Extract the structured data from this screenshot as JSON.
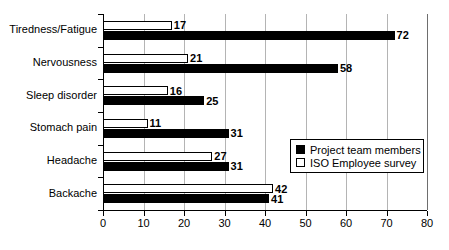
{
  "chart_data": {
    "type": "bar",
    "orientation": "horizontal",
    "title": "",
    "xlabel": "",
    "ylabel": "",
    "xlim": [
      0,
      80
    ],
    "xticks": [
      0,
      10,
      20,
      30,
      40,
      50,
      60,
      70,
      80
    ],
    "grid": true,
    "grid_axis": "x",
    "legend_position": "center-right",
    "categories": [
      "Tiredness/Fatigue",
      "Nervousness",
      "Sleep disorder",
      "Stomach pain",
      "Headache",
      "Backache"
    ],
    "series": [
      {
        "name": "Project team members",
        "style": "filled",
        "color": "#000000",
        "values": [
          72,
          58,
          25,
          31,
          31,
          41
        ]
      },
      {
        "name": "ISO Employee survey",
        "style": "hollow",
        "color": "#ffffff",
        "values": [
          17,
          21,
          16,
          11,
          27,
          42
        ]
      }
    ]
  },
  "legend": {
    "entries": [
      {
        "label": "Project team members",
        "style": "filled"
      },
      {
        "label": "ISO Employee survey",
        "style": "hollow"
      }
    ]
  }
}
